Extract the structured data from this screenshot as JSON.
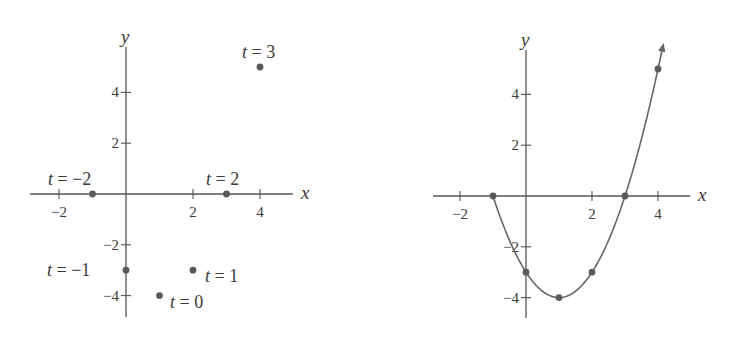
{
  "colors": {
    "axis": "#555555",
    "point": "#5a5a5a",
    "curve": "#666666",
    "text": "#3a3a3a",
    "background": "#ffffff"
  },
  "chart_data": [
    {
      "type": "scatter",
      "title": "",
      "xlabel": "x",
      "ylabel": "y",
      "xlim": [
        -2.9,
        5
      ],
      "ylim": [
        -4.9,
        5.8
      ],
      "grid": false,
      "x_ticks": [
        -2,
        2,
        4
      ],
      "y_ticks": [
        4,
        2,
        -2,
        -4
      ],
      "points": [
        {
          "t": -2,
          "x": -1,
          "y": 0,
          "label": "t = −2"
        },
        {
          "t": -1,
          "x": 0,
          "y": -3,
          "label": "t = −1"
        },
        {
          "t": 0,
          "x": 1,
          "y": -4,
          "label": "t = 0"
        },
        {
          "t": 1,
          "x": 2,
          "y": -3,
          "label": "t = 1"
        },
        {
          "t": 2,
          "x": 3,
          "y": 0,
          "label": "t = 2"
        },
        {
          "t": 3,
          "x": 4,
          "y": 5,
          "label": "t = 3"
        }
      ],
      "layout": {
        "origin_px": [
          126,
          194
        ],
        "scale_px": [
          33.5,
          25.4
        ],
        "x_axis_px": [
          30,
          293
        ],
        "y_axis_px": [
          47,
          317
        ],
        "label_positions": [
          {
            "x": 48,
            "y": 185
          },
          {
            "x": 47,
            "y": 276
          },
          {
            "x": 170,
            "y": 308
          },
          {
            "x": 205,
            "y": 282
          },
          {
            "x": 206,
            "y": 185
          },
          {
            "x": 242,
            "y": 58
          }
        ]
      }
    },
    {
      "type": "line",
      "title": "",
      "xlabel": "x",
      "ylabel": "y",
      "xlim": [
        -2.8,
        4.9
      ],
      "ylim": [
        -4.8,
        5.8
      ],
      "grid": false,
      "x_ticks": [
        -2,
        2,
        4
      ],
      "y_ticks": [
        4,
        2,
        -2,
        -4
      ],
      "curve": {
        "equation": "x = t + 1, y = t^2 - 4  (y = (x-1)^2 - 4)",
        "x_range": [
          -1,
          4.15
        ],
        "arrow_at_end": true
      },
      "points": [
        {
          "x": -1,
          "y": 0
        },
        {
          "x": 0,
          "y": -3
        },
        {
          "x": 1,
          "y": -4
        },
        {
          "x": 2,
          "y": -3
        },
        {
          "x": 3,
          "y": 0
        },
        {
          "x": 4,
          "y": 5
        }
      ],
      "layout": {
        "origin_px": [
          526,
          196
        ],
        "scale_px": [
          33,
          25.4
        ],
        "x_axis_px": [
          433,
          690
        ],
        "y_axis_px": [
          50,
          318
        ]
      }
    }
  ]
}
